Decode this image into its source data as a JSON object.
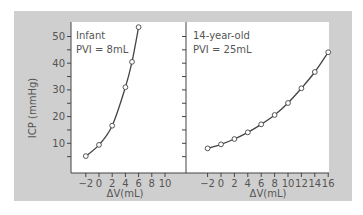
{
  "chart_data": {
    "type": "line",
    "ylabel": "ICP (mmHg)",
    "ylim": [
      0,
      55
    ],
    "yticks": [
      10,
      20,
      30,
      40,
      50
    ],
    "grid": false,
    "colors": {
      "frame": "#cfcfcf",
      "panel": "#ffffff",
      "line": "#444444",
      "text": "#555555"
    },
    "panels": [
      {
        "title": "Infant",
        "subtitle": "PVI = 8mL",
        "xlabel": "ΔV(mL)",
        "xticks": [
          -2,
          0,
          2,
          4,
          6,
          8,
          10
        ],
        "xlim": [
          -2,
          10
        ],
        "series": [
          {
            "name": "Infant",
            "x": [
              -2,
              0,
              2,
              4,
              5,
              6
            ],
            "y": [
              5.2,
              9.4,
              16.6,
              31,
              40.5,
              53.5
            ]
          }
        ]
      },
      {
        "title": "14-year-old",
        "subtitle": "PVI = 25mL",
        "xlabel": "ΔV(mL)",
        "xticks": [
          -2,
          0,
          2,
          4,
          6,
          8,
          10,
          12,
          14,
          16
        ],
        "xlim": [
          -2,
          16
        ],
        "series": [
          {
            "name": "14-year-old",
            "x": [
              -2,
              0,
              2,
              4,
              6,
              8,
              10,
              12,
              14,
              16
            ],
            "y": [
              8.1,
              9.6,
              11.6,
              14.1,
              17.1,
              20.6,
              25.1,
              30.6,
              36.7,
              44.1
            ]
          }
        ]
      }
    ]
  }
}
